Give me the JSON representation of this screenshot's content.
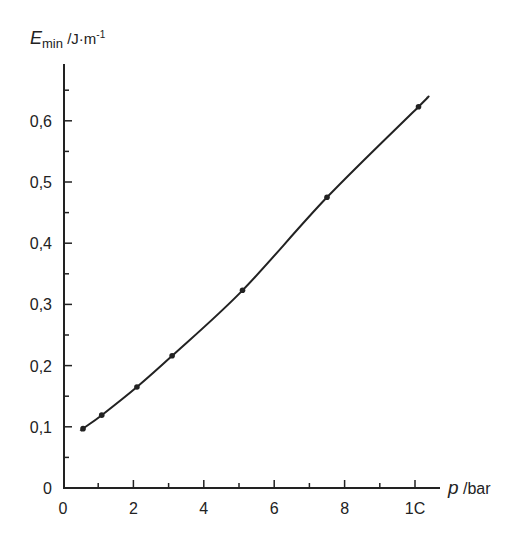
{
  "chart_data": {
    "type": "line",
    "title": "",
    "xlabel": "p /bar",
    "ylabel": "E_min /J·m⁻¹",
    "xlabel_parts": {
      "var": "p",
      "unit": " /bar"
    },
    "ylabel_parts": {
      "var": "E",
      "sub": "min",
      "unit": " /J·m",
      "sup": "-1"
    },
    "xlim": [
      0,
      10.5
    ],
    "ylim": [
      0,
      0.68
    ],
    "x_ticks": [
      0,
      2,
      4,
      6,
      8,
      10
    ],
    "x_tick_labels": [
      "0",
      "2",
      "4",
      "6",
      "8",
      "1C"
    ],
    "y_ticks": [
      0,
      0.1,
      0.2,
      0.3,
      0.4,
      0.5,
      0.6
    ],
    "y_tick_labels": [
      "0",
      "0,1",
      "0,2",
      "0,3",
      "0,4",
      "0,5",
      "0,6"
    ],
    "grid": false,
    "legend": null,
    "series": [
      {
        "name": "E_min",
        "x": [
          0.57,
          1.1,
          2.1,
          3.1,
          5.1,
          7.5,
          10.1
        ],
        "values": [
          0.097,
          0.119,
          0.165,
          0.216,
          0.323,
          0.475,
          0.623
        ],
        "curve_extent": {
          "x_start": 0.5,
          "x_end": 10.35,
          "y_end": 0.638
        }
      }
    ]
  }
}
